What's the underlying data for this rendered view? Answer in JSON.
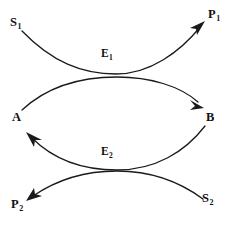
{
  "diagram": {
    "type": "coupled-enzyme-reaction-bowtie",
    "background_color": "#ffffff",
    "stroke_color": "#1a1a1a",
    "text_color": "#111111",
    "nodes": [
      {
        "id": "s1",
        "base": "S",
        "sub": "1",
        "role": "substrate",
        "x": 10,
        "y": 16
      },
      {
        "id": "p1",
        "base": "P",
        "sub": "1",
        "role": "product",
        "x": 208,
        "y": 8
      },
      {
        "id": "a",
        "base": "A",
        "sub": "",
        "role": "cosubstrate",
        "x": 12,
        "y": 111
      },
      {
        "id": "b",
        "base": "B",
        "sub": "",
        "role": "cosubstrate",
        "x": 206,
        "y": 111
      },
      {
        "id": "p2",
        "base": "P",
        "sub": "2",
        "role": "product",
        "x": 11,
        "y": 198
      },
      {
        "id": "s2",
        "base": "S",
        "sub": "2",
        "role": "substrate",
        "x": 202,
        "y": 192
      }
    ],
    "enzymes": [
      {
        "id": "e1",
        "base": "E",
        "sub": "1",
        "x": 101,
        "y": 48
      },
      {
        "id": "e2",
        "base": "E",
        "sub": "2",
        "x": 101,
        "y": 146
      }
    ],
    "arrows": [
      {
        "id": "s1-to-p1",
        "from": "s1",
        "to": "p1",
        "enzyme": "e1",
        "curvature": "sag-down"
      },
      {
        "id": "a-to-b",
        "from": "a",
        "to": "b",
        "enzyme": "e1",
        "curvature": "arc-up"
      },
      {
        "id": "b-to-a",
        "from": "b",
        "to": "a",
        "enzyme": "e2",
        "curvature": "sag-down"
      },
      {
        "id": "s2-to-p2",
        "from": "s2",
        "to": "p2",
        "enzyme": "e2",
        "curvature": "arc-up"
      }
    ]
  }
}
